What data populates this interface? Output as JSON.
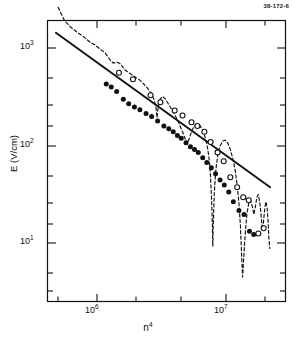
{
  "figure": {
    "corner_id": "38-172-6",
    "background": "#ffffff",
    "ink": "#111111"
  },
  "axes": {
    "x_label": "n",
    "x_label_exponent": "4",
    "y_label": "E (V/cm)",
    "x_ticks": [
      {
        "value": 1000000,
        "mantissa": "10",
        "exponent": "6",
        "px": 97
      },
      {
        "value": 10000000,
        "mantissa": "10",
        "exponent": "7",
        "px": 226
      }
    ],
    "y_ticks": [
      {
        "value": 1000,
        "mantissa": "10",
        "exponent": "3",
        "px": 48
      },
      {
        "value": 100,
        "mantissa": "10",
        "exponent": "2",
        "px": 146
      },
      {
        "value": 10,
        "mantissa": "10",
        "exponent": "1",
        "px": 243
      }
    ]
  },
  "chart_data": {
    "type": "scatter",
    "title": "",
    "xlabel": "n^4",
    "ylabel": "E (V/cm)",
    "xscale": "log",
    "yscale": "log",
    "xlim": [
      400000,
      30000000
    ],
    "ylim": [
      3,
      3000
    ],
    "grid": false,
    "legend": "none",
    "series": [
      {
        "name": "filled-circles",
        "marker": "filled-circle",
        "color": "#111111",
        "points": [
          [
            1180000,
            430
          ],
          [
            1290000,
            400
          ],
          [
            1420000,
            360
          ],
          [
            1600000,
            300
          ],
          [
            1760000,
            270
          ],
          [
            1950000,
            250
          ],
          [
            2150000,
            235
          ],
          [
            2400000,
            215
          ],
          [
            2650000,
            200
          ],
          [
            2950000,
            180
          ],
          [
            3300000,
            160
          ],
          [
            3600000,
            150
          ],
          [
            3900000,
            140
          ],
          [
            4200000,
            128
          ],
          [
            4500000,
            120
          ],
          [
            4900000,
            108
          ],
          [
            5300000,
            98
          ],
          [
            5700000,
            92
          ],
          [
            6100000,
            86
          ],
          [
            6600000,
            76
          ],
          [
            7100000,
            68
          ],
          [
            7700000,
            60
          ],
          [
            8300000,
            52
          ],
          [
            9000000,
            45
          ],
          [
            9700000,
            40
          ],
          [
            10500000,
            34
          ],
          [
            11400000,
            27
          ],
          [
            12600000,
            22
          ],
          [
            13800000,
            20
          ],
          [
            15200000,
            13.5
          ],
          [
            16400000,
            12.5
          ]
        ]
      },
      {
        "name": "open-circles",
        "marker": "open-circle",
        "color": "#111111",
        "points": [
          [
            1480000,
            560
          ],
          [
            1900000,
            480
          ],
          [
            2600000,
            330
          ],
          [
            3100000,
            280
          ],
          [
            4000000,
            230
          ],
          [
            4600000,
            205
          ],
          [
            5400000,
            175
          ],
          [
            6000000,
            160
          ],
          [
            6800000,
            140
          ],
          [
            7600000,
            110
          ],
          [
            8600000,
            86
          ],
          [
            9600000,
            70
          ],
          [
            10800000,
            48
          ],
          [
            12200000,
            38
          ],
          [
            13600000,
            30
          ],
          [
            15000000,
            28
          ],
          [
            17800000,
            12.8
          ],
          [
            19600000,
            14.5
          ]
        ]
      }
    ],
    "reference_line": {
      "name": "power-law-fit",
      "style": "solid",
      "color": "#111111",
      "start": [
        480000,
        1430
      ],
      "end": [
        22000000,
        38
      ],
      "description": "straight line on log-log axes, negative slope"
    },
    "theory_curve": {
      "name": "oscillating-theory-curve",
      "style": "dashed",
      "color": "#111111",
      "description": "dashed curve with deep minima and recovering maxima",
      "points": [
        [
          500000,
          2600
        ],
        [
          560000,
          1900
        ],
        [
          620000,
          1650
        ],
        [
          700000,
          1450
        ],
        [
          790000,
          1300
        ],
        [
          880000,
          1150
        ],
        [
          960000,
          1080
        ],
        [
          1050000,
          980
        ],
        [
          1150000,
          900
        ],
        [
          1260000,
          760
        ],
        [
          1340000,
          700
        ],
        [
          1420000,
          720
        ],
        [
          1520000,
          690
        ],
        [
          1640000,
          600
        ],
        [
          1760000,
          560
        ],
        [
          1880000,
          530
        ],
        [
          2000000,
          500
        ],
        [
          2150000,
          470
        ],
        [
          2300000,
          430
        ],
        [
          2460000,
          390
        ],
        [
          2620000,
          350
        ],
        [
          2760000,
          300
        ],
        [
          2860000,
          250
        ],
        [
          2920000,
          195
        ],
        [
          2980000,
          250
        ],
        [
          3080000,
          300
        ],
        [
          3220000,
          320
        ],
        [
          3400000,
          300
        ],
        [
          3600000,
          265
        ],
        [
          3800000,
          235
        ],
        [
          4000000,
          210
        ],
        [
          4200000,
          185
        ],
        [
          4400000,
          160
        ],
        [
          4600000,
          140
        ],
        [
          4800000,
          120
        ],
        [
          5000000,
          105
        ],
        [
          5200000,
          120
        ],
        [
          5450000,
          145
        ],
        [
          5700000,
          160
        ],
        [
          5950000,
          168
        ],
        [
          6200000,
          165
        ],
        [
          6500000,
          150
        ],
        [
          6800000,
          130
        ],
        [
          7100000,
          105
        ],
        [
          7350000,
          80
        ],
        [
          7550000,
          55
        ],
        [
          7700000,
          32
        ],
        [
          7820000,
          18
        ],
        [
          7900000,
          9.5
        ],
        [
          7980000,
          17
        ],
        [
          8120000,
          34
        ],
        [
          8350000,
          58
        ],
        [
          8650000,
          82
        ],
        [
          9000000,
          100
        ],
        [
          9400000,
          112
        ],
        [
          9850000,
          115
        ],
        [
          10300000,
          108
        ],
        [
          10800000,
          92
        ],
        [
          11300000,
          74
        ],
        [
          11800000,
          56
        ],
        [
          12200000,
          40
        ],
        [
          12600000,
          26
        ],
        [
          12950000,
          15
        ],
        [
          13200000,
          8
        ],
        [
          13450000,
          4.6
        ],
        [
          13700000,
          7
        ],
        [
          14050000,
          12
        ],
        [
          14500000,
          20
        ],
        [
          15000000,
          26
        ],
        [
          15500000,
          28
        ],
        [
          16000000,
          24
        ],
        [
          16450000,
          20
        ],
        [
          16900000,
          24
        ],
        [
          17350000,
          30
        ],
        [
          17800000,
          32
        ],
        [
          18250000,
          27
        ],
        [
          18700000,
          20
        ],
        [
          19100000,
          14
        ],
        [
          19450000,
          16
        ],
        [
          19900000,
          22
        ],
        [
          20350000,
          27
        ],
        [
          20800000,
          24
        ],
        [
          21200000,
          17
        ],
        [
          21550000,
          11
        ],
        [
          21850000,
          9
        ]
      ]
    }
  }
}
